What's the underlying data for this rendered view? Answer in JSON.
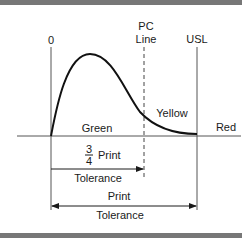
{
  "diagram": {
    "title_bar_color": "#777777",
    "labels": {
      "zero": "0",
      "pc_line_top": "PC",
      "pc_line_bottom": "Line",
      "usl": "USL",
      "green": "Green",
      "yellow": "Yellow",
      "red": "Red",
      "fraction_numerator": "3",
      "fraction_denominator": "4",
      "three_quarter_print": "Print",
      "three_quarter_tolerance": "Tolerance",
      "print": "Print",
      "print_tolerance": "Tolerance"
    },
    "regions": [
      {
        "name": "Green",
        "between": [
          "0",
          "PC Line"
        ]
      },
      {
        "name": "Yellow",
        "between": [
          "PC Line",
          "USL"
        ]
      },
      {
        "name": "Red",
        "beyond": "USL"
      }
    ],
    "dimensions": [
      {
        "label": "3/4 Print Tolerance",
        "from": "0",
        "to": "PC Line"
      },
      {
        "label": "Print Tolerance",
        "from": "0",
        "to": "USL"
      }
    ],
    "curve": "right-skewed distribution starting at 0, peaking early, tailing to USL"
  }
}
